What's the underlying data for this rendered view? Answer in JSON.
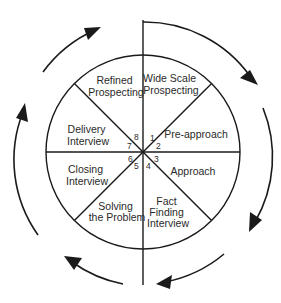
{
  "diagram": {
    "segments": [
      {
        "number": "1",
        "line1": "Wide Scale",
        "line2": "Prospecting"
      },
      {
        "number": "2",
        "line1": "Pre-approach",
        "line2": ""
      },
      {
        "number": "3",
        "line1": "Approach",
        "line2": ""
      },
      {
        "number": "4",
        "line1": "Fact",
        "line2": "Finding",
        "line3": "Interview"
      },
      {
        "number": "5",
        "line1": "Solving",
        "line2": "the Problem"
      },
      {
        "number": "6",
        "line1": "Closing",
        "line2": "Interview"
      },
      {
        "number": "7",
        "line1": "Delivery",
        "line2": "Interview"
      },
      {
        "number": "8",
        "line1": "Refined",
        "line2": "Prospecting"
      }
    ],
    "arrow_direction": "clockwise",
    "colors": {
      "stroke": "#1a1a1a",
      "text": "#2a2a2a",
      "background": "#ffffff"
    }
  }
}
